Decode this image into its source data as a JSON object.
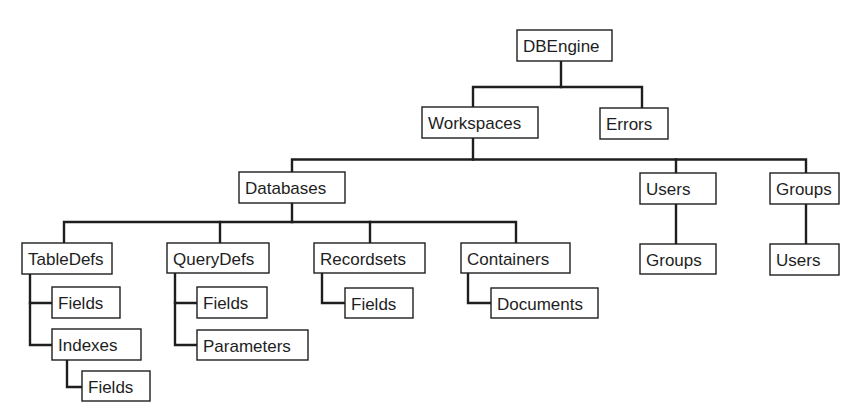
{
  "diagram": {
    "type": "hierarchy-tree",
    "title": "",
    "colors": {
      "line": "#1e1e1e",
      "box_fill": "#ffffff",
      "text": "#1e1e1e"
    },
    "nodes": [
      {
        "id": "dbengine",
        "label": "DBEngine"
      },
      {
        "id": "workspaces",
        "label": "Workspaces"
      },
      {
        "id": "errors",
        "label": "Errors"
      },
      {
        "id": "databases",
        "label": "Databases"
      },
      {
        "id": "users",
        "label": "Users"
      },
      {
        "id": "groups",
        "label": "Groups"
      },
      {
        "id": "users_groups",
        "label": "Groups"
      },
      {
        "id": "groups_users",
        "label": "Users"
      },
      {
        "id": "tabledefs",
        "label": "TableDefs"
      },
      {
        "id": "querydefs",
        "label": "QueryDefs"
      },
      {
        "id": "recordsets",
        "label": "Recordsets"
      },
      {
        "id": "containers",
        "label": "Containers"
      },
      {
        "id": "tabledefs_fields",
        "label": "Fields"
      },
      {
        "id": "indexes",
        "label": "Indexes"
      },
      {
        "id": "indexes_fields",
        "label": "Fields"
      },
      {
        "id": "querydefs_fields",
        "label": "Fields"
      },
      {
        "id": "parameters",
        "label": "Parameters"
      },
      {
        "id": "recordsets_fields",
        "label": "Fields"
      },
      {
        "id": "documents",
        "label": "Documents"
      }
    ],
    "edges": [
      {
        "from": "dbengine",
        "to": "workspaces"
      },
      {
        "from": "dbengine",
        "to": "errors"
      },
      {
        "from": "workspaces",
        "to": "databases"
      },
      {
        "from": "workspaces",
        "to": "users"
      },
      {
        "from": "workspaces",
        "to": "groups"
      },
      {
        "from": "users",
        "to": "users_groups"
      },
      {
        "from": "groups",
        "to": "groups_users"
      },
      {
        "from": "databases",
        "to": "tabledefs"
      },
      {
        "from": "databases",
        "to": "querydefs"
      },
      {
        "from": "databases",
        "to": "recordsets"
      },
      {
        "from": "databases",
        "to": "containers"
      },
      {
        "from": "tabledefs",
        "to": "tabledefs_fields"
      },
      {
        "from": "tabledefs",
        "to": "indexes"
      },
      {
        "from": "indexes",
        "to": "indexes_fields"
      },
      {
        "from": "querydefs",
        "to": "querydefs_fields"
      },
      {
        "from": "querydefs",
        "to": "parameters"
      },
      {
        "from": "recordsets",
        "to": "recordsets_fields"
      },
      {
        "from": "containers",
        "to": "documents"
      }
    ]
  }
}
